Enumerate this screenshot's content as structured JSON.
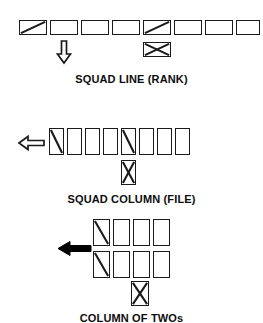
{
  "document": {
    "kind": "military-squad-formation-diagram",
    "background_color": "#ffffff",
    "ink_color": "#1a1a1a"
  },
  "formations": [
    {
      "id": "squad-line-rank",
      "title": "SQUAD LINE (RANK)",
      "box_orientation": "horizontal",
      "box_count": 8,
      "leader_marks": [
        {
          "index": 0,
          "symbol": "diagonal"
        },
        {
          "index": 4,
          "symbol": "diagonal"
        }
      ],
      "direction_arrow": {
        "symbol": "arrow-down-hollow",
        "style": "hollow",
        "points": "down",
        "below_box_index": 1
      },
      "trailing_marker": {
        "symbol": "box-with-x",
        "below_box_index": 4,
        "orientation": "horizontal"
      }
    },
    {
      "id": "squad-column-file",
      "title": "SQUAD COLUMN (FILE)",
      "box_orientation": "vertical",
      "box_count": 8,
      "leader_marks": [
        {
          "index": 0,
          "symbol": "diagonal"
        },
        {
          "index": 4,
          "symbol": "diagonal"
        }
      ],
      "direction_arrow": {
        "symbol": "arrow-left-hollow",
        "style": "hollow",
        "points": "left",
        "left_of_box_index": 0
      },
      "trailing_marker": {
        "symbol": "box-with-x",
        "below_box_index": 4,
        "orientation": "vertical"
      }
    },
    {
      "id": "column-of-twos",
      "title": "COLUMN OF TWOs",
      "box_orientation": "vertical",
      "rows": 2,
      "columns": 4,
      "box_count": 8,
      "leader_marks": [
        {
          "row": 0,
          "column": 0,
          "symbol": "diagonal"
        },
        {
          "row": 1,
          "column": 0,
          "symbol": "diagonal"
        }
      ],
      "direction_arrow": {
        "symbol": "arrow-left-solid",
        "style": "solid",
        "points": "left"
      },
      "trailing_marker": {
        "symbol": "box-with-x",
        "below_column_index": 2,
        "orientation": "vertical"
      }
    }
  ]
}
